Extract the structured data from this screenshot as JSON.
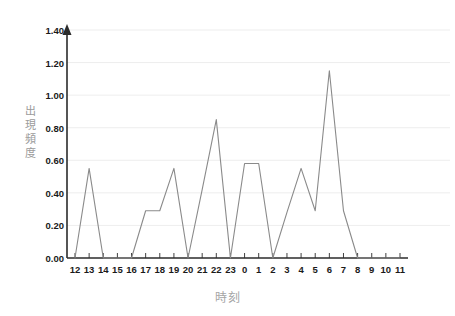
{
  "chart_data": {
    "type": "line",
    "title": "",
    "xlabel": "時刻",
    "ylabel": "出現頻度",
    "categories": [
      "12",
      "13",
      "14",
      "15",
      "16",
      "17",
      "18",
      "19",
      "20",
      "21",
      "22",
      "23",
      "0",
      "1",
      "2",
      "3",
      "4",
      "5",
      "6",
      "7",
      "8",
      "9",
      "10",
      "11"
    ],
    "values": [
      0.0,
      0.55,
      0.0,
      0.0,
      0.0,
      0.29,
      0.29,
      0.55,
      0.0,
      0.42,
      0.85,
      0.0,
      0.58,
      0.58,
      0.0,
      0.28,
      0.55,
      0.29,
      1.15,
      0.29,
      0.0,
      0.0,
      0.0,
      0.0
    ],
    "ylim": [
      0.0,
      1.4
    ],
    "ytick_values": [
      0.0,
      0.2,
      0.4,
      0.6,
      0.8,
      1.0,
      1.2,
      1.4
    ],
    "ytick_labels": [
      "0.00",
      "0.20",
      "0.40",
      "0.60",
      "0.80",
      "1.00",
      "1.20",
      "1.40"
    ],
    "grid": true,
    "grid_color": "#e8e8e8",
    "legend": false,
    "series_color": "#8a8a8a",
    "axis_color": "#2b2b2b",
    "axis_title_color": "#a5a5a5",
    "background": "#ffffff"
  }
}
